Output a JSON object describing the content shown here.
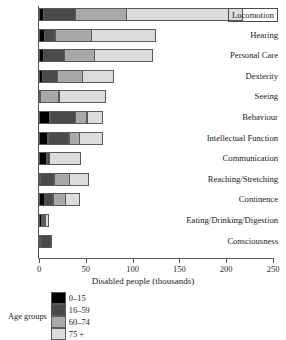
{
  "chart_data": {
    "type": "bar",
    "orientation": "horizontal",
    "stacked": true,
    "title": "",
    "xlabel": "Disabled people (thousands)",
    "ylabel": "",
    "xlim": [
      0,
      250
    ],
    "xticks": [
      0,
      50,
      100,
      150,
      200,
      250
    ],
    "grid": false,
    "legend_title": "Age groups",
    "legend_position": "bottom",
    "categories": [
      "Locomotion",
      "Hearing",
      "Personal Care",
      "Dexterity",
      "Seeing",
      "Behaviour",
      "Intellectual Function",
      "Communication",
      "Reaching/Stretching",
      "Continence",
      "Eating/Drinking/Digestion",
      "Consciousness"
    ],
    "series": [
      {
        "name": "0–15",
        "color": "#000000",
        "values": [
          5,
          6,
          5,
          4,
          2,
          12,
          10,
          9,
          2,
          6,
          3,
          2
        ]
      },
      {
        "name": "16–59",
        "color": "#4a4a4a",
        "values": [
          35,
          12,
          23,
          17,
          0,
          28,
          23,
          3,
          15,
          10,
          2,
          12
        ]
      },
      {
        "name": "60–74",
        "color": "#a8a8a8",
        "values": [
          55,
          40,
          33,
          27,
          20,
          13,
          12,
          0,
          17,
          14,
          3,
          0
        ]
      },
      {
        "name": "75 +",
        "color": "#dcdcdc",
        "values": [
          125,
          69,
          63,
          34,
          51,
          17,
          25,
          34,
          21,
          16,
          5,
          0
        ]
      }
    ],
    "totals": [
      220,
      127,
      124,
      82,
      73,
      70,
      70,
      46,
      55,
      46,
      13,
      14
    ]
  },
  "axis": {
    "tick_labels": [
      "0",
      "50",
      "100",
      "150",
      "200",
      "250"
    ],
    "x_title": "Disabled people (thousands)"
  },
  "legend": {
    "title": "Age groups",
    "items": [
      {
        "label": "0–15",
        "color": "#000000"
      },
      {
        "label": "16–59",
        "color": "#4a4a4a"
      },
      {
        "label": "60–74",
        "color": "#a8a8a8"
      },
      {
        "label": "75 +",
        "color": "#dcdcdc"
      }
    ]
  }
}
